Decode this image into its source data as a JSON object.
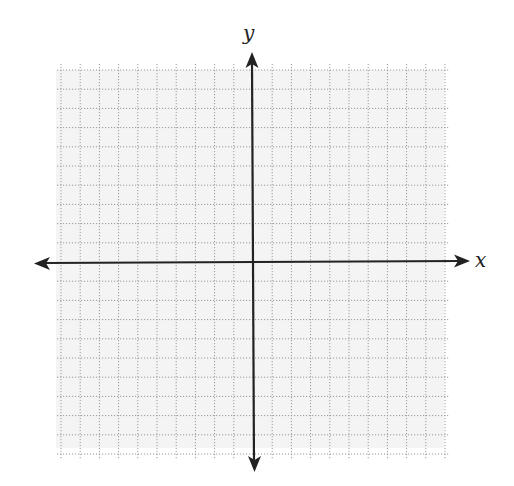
{
  "diagram": {
    "type": "coordinate-grid",
    "x_axis_label": "x",
    "y_axis_label": "y",
    "grid": {
      "squares_left": 10,
      "squares_right": 10,
      "squares_up": 10,
      "squares_down": 10,
      "line_style": "dotted",
      "line_color": "#9a9a9a",
      "background": "#f4f4f4"
    },
    "axes": {
      "color": "#222222",
      "arrows": "both-ends"
    }
  }
}
